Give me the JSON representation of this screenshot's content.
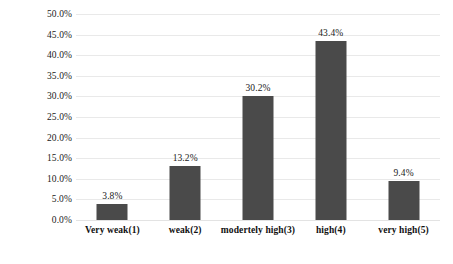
{
  "chart_data": {
    "type": "bar",
    "title": "",
    "subtitle": "",
    "xlabel": "",
    "ylabel": "",
    "categories": [
      "Very weak(1)",
      "weak(2)",
      "modertely high(3)",
      "high(4)",
      "very high(5)"
    ],
    "values": [
      3.8,
      13.2,
      30.2,
      43.4,
      9.4
    ],
    "value_labels": [
      "3.8%",
      "13.2%",
      "30.2%",
      "43.4%",
      "9.4%"
    ],
    "ylim": [
      0,
      50
    ],
    "ytick_step": 5,
    "ytick_labels": [
      "50.0%",
      "45.0%",
      "40.0%",
      "35.0%",
      "30.0%",
      "25.0%",
      "20.0%",
      "15.0%",
      "10.0%",
      "5.0%",
      "0.0%"
    ],
    "ytick_values": [
      50,
      45,
      40,
      35,
      30,
      25,
      20,
      15,
      10,
      5,
      0
    ],
    "grid": true,
    "grid_axis": "y",
    "legend": false,
    "legend_position": "none",
    "series": [
      {
        "name": "",
        "values": [
          3.8,
          13.2,
          30.2,
          43.4,
          9.4
        ]
      }
    ],
    "colors": {
      "bar_fill": "#4a4a4a",
      "gridline": "#e9e9e9",
      "background": "#ffffff",
      "text": "#1a1a1a"
    }
  }
}
